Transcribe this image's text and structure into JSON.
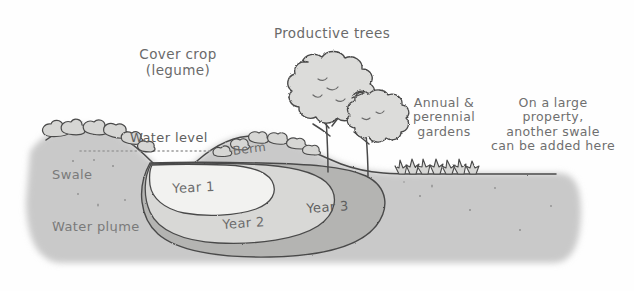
{
  "diagram": {
    "labels": {
      "cover_crop": "Cover crop\n(legume)",
      "productive_trees": "Productive trees",
      "annual_gardens": "Annual &\nperennial\ngardens",
      "large_property": "On a large\nproperty,\nanother swale\ncan be added here",
      "water_level": "Water level",
      "swale": "Swale",
      "water_plume": "Water plume",
      "berm": "Berm",
      "year_1": "Year 1",
      "year_2": "Year 2",
      "year_3": "Year 3"
    },
    "colors": {
      "background": "#fefefe",
      "soil": "#c9c9c9",
      "soil_edge": "#bdbdbd",
      "year_1": "#f2f2f0",
      "year_2": "#d8d8d6",
      "year_3": "#b4b4b2",
      "ink": "#4a4a4a",
      "vegetation_fill": "#d6d6d4",
      "tree_fill": "#dcdcda",
      "label_text": "#6a6a6a",
      "dotted_water_line": "#9b9b9b"
    },
    "elements": {
      "swale_basin": "depression holding water at left of berm",
      "berm": "raised mound of soil downslope of swale",
      "trees": 2,
      "garden_plants": 7,
      "cover_crop_bushes": 6
    }
  }
}
